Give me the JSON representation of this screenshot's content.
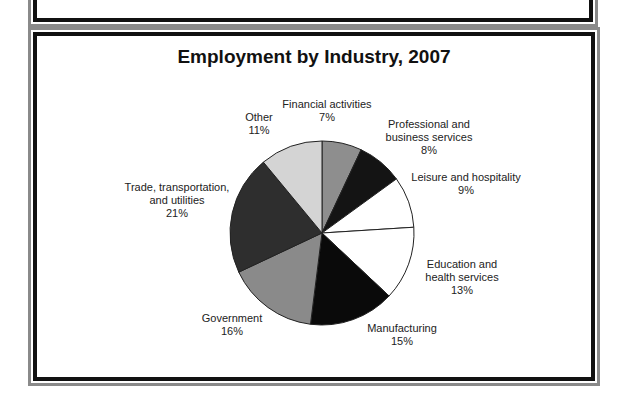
{
  "chart_data": {
    "type": "pie",
    "title": "Employment by Industry, 2007",
    "slices": [
      {
        "label": "Financial activities",
        "value": 7,
        "color": "#8e8e8e"
      },
      {
        "label": "Professional and business services",
        "value": 8,
        "color": "#141414"
      },
      {
        "label": "Leisure and hospitality",
        "value": 9,
        "color": "#ffffff"
      },
      {
        "label": "Education and health services",
        "value": 13,
        "color": "#ffffff"
      },
      {
        "label": "Manufacturing",
        "value": 15,
        "color": "#0a0a0a"
      },
      {
        "label": "Government",
        "value": 16,
        "color": "#8a8a8a"
      },
      {
        "label": "Trade, transportation, and utilities",
        "value": 21,
        "color": "#2e2e2e"
      },
      {
        "label": "Other",
        "value": 11,
        "color": "#d4d4d4"
      }
    ],
    "start_angle": "12 o'clock, clockwise"
  },
  "labels": {
    "financial": {
      "line1": "Financial activities",
      "pct": "7%"
    },
    "professional": {
      "line1": "Professional and",
      "line2": "business services",
      "pct": "8%"
    },
    "leisure": {
      "line1": "Leisure and hospitality",
      "pct": "9%"
    },
    "education": {
      "line1": "Education and",
      "line2": "health services",
      "pct": "13%"
    },
    "manufacturing": {
      "line1": "Manufacturing",
      "pct": "15%"
    },
    "government": {
      "line1": "Government",
      "pct": "16%"
    },
    "trade": {
      "line1": "Trade, transportation,",
      "line2": "and utilities",
      "pct": "21%"
    },
    "other": {
      "line1": "Other",
      "pct": "11%"
    }
  }
}
